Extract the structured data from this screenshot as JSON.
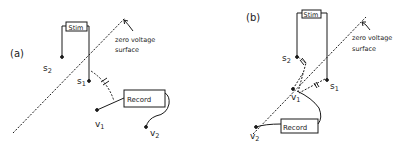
{
  "panels": [
    {
      "id": "a",
      "label": "(a)",
      "stim_label": "Stim",
      "record_label": "Record",
      "surface_label_line1": "zero voltage",
      "surface_label_line2": "surface",
      "s1": "s",
      "s1_sub": "1",
      "s2": "s",
      "s2_sub": "2",
      "v1": "v",
      "v1_sub": "1",
      "v2": "v",
      "v2_sub": "2"
    },
    {
      "id": "b",
      "label": "(b)",
      "stim_label": "Stim",
      "record_label": "Record",
      "surface_label_line1": "zero voltage",
      "surface_label_line2": "surface",
      "s1": "s",
      "s1_sub": "1",
      "s2": "s",
      "s2_sub": "2",
      "v1": "v",
      "v1_sub": "1",
      "v2": "v",
      "v2_sub": "2"
    }
  ],
  "colors": {
    "ink": "#1a1a1a",
    "background": "#ffffff"
  }
}
